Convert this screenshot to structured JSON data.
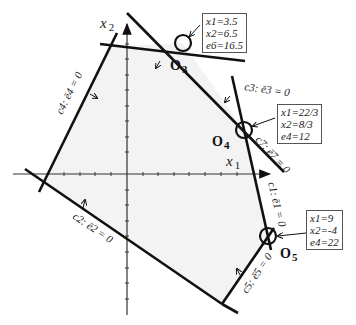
{
  "diagram": {
    "type": "linear-programming-feasible-region",
    "axes": {
      "x_label": "x 1",
      "y_label": "x 2"
    },
    "constraints": [
      {
        "id": "c1",
        "label": "c1: ē1 = 0"
      },
      {
        "id": "c2",
        "label": "c2: ē2 = 0"
      },
      {
        "id": "c3",
        "label": "c3: ē3 = 0"
      },
      {
        "id": "c4",
        "label": "c4: ē4 = 0"
      },
      {
        "id": "c5",
        "label": "c5: ē5 = 0"
      },
      {
        "id": "c7",
        "label": "c7: ē7 = 0"
      }
    ],
    "vertices": [
      {
        "id": "O3",
        "label": "O3",
        "info": [
          "x1=3.5",
          "x2=6.5",
          "e6=16.5"
        ]
      },
      {
        "id": "O4",
        "label": "O4",
        "info": [
          "x1=22/3",
          "x2=8/3",
          "e4=12"
        ]
      },
      {
        "id": "O5",
        "label": "O5",
        "info": [
          "x1=9",
          "x2=-4",
          "e4=22"
        ]
      }
    ]
  },
  "labels": {
    "x_axis": "x",
    "x_axis_sub": "1",
    "y_axis": "x",
    "y_axis_sub": "2",
    "c1": "c1: ē1 = 0",
    "c2": "c2: ē2 = 0",
    "c3": "c3: ē3 = 0",
    "c4": "c4: ē4 = 0",
    "c5": "c5: ē5 = 0",
    "c7": "c7: ē7 = 0",
    "o3": "O",
    "o3_sub": "3",
    "o4": "O",
    "o4_sub": "4",
    "o5": "O",
    "o5_sub": "5"
  },
  "boxes": {
    "o3": {
      "l1": "x1=3.5",
      "l2": "x2=6.5",
      "l3": "e6=16.5"
    },
    "o4": {
      "l1": "x1=22/3",
      "l2": "x2=8/3",
      "l3": "e4=12"
    },
    "o5": {
      "l1": "x1=9",
      "l2": "x2=-4",
      "l3": "e4=22"
    }
  },
  "colors": {
    "line": "#111111",
    "region": "#f4f4f4",
    "axis": "#333333"
  }
}
